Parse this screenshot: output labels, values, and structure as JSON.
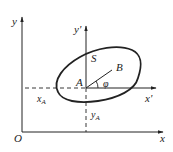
{
  "diagram": {
    "stroke_color": "#222222",
    "labels": {
      "y_axis": "y",
      "x_axis": "x",
      "origin": "O",
      "y_prime": "y'",
      "x_prime": "x'",
      "body": "S",
      "point_A": "A",
      "point_B": "B",
      "angle": "φ",
      "x_A": "x",
      "x_A_sub": "A",
      "y_A": "y",
      "y_A_sub": "A"
    }
  }
}
